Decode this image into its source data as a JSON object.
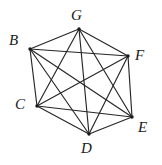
{
  "figure": {
    "name": "complete-graph-k6",
    "background_color": "#ffffff",
    "edge_color": "#262626",
    "label_color": "#1a1a1a",
    "vertex_dot_color": "#1a1a1a",
    "width": 162,
    "height": 165
  },
  "vertices": [
    {
      "id": "G",
      "label": "G",
      "x": 79,
      "y": 29,
      "label_x": 71,
      "label_y": 8
    },
    {
      "id": "B",
      "label": "B",
      "x": 30,
      "y": 49,
      "label_x": 9,
      "label_y": 33
    },
    {
      "id": "F",
      "label": "F",
      "x": 128,
      "y": 56,
      "label_x": 135,
      "label_y": 48
    },
    {
      "id": "C",
      "label": "C",
      "x": 37,
      "y": 106,
      "label_x": 15,
      "label_y": 97
    },
    {
      "id": "E",
      "label": "E",
      "x": 132,
      "y": 117,
      "label_x": 138,
      "label_y": 120
    },
    {
      "id": "D",
      "label": "D",
      "x": 89,
      "y": 134,
      "label_x": 81,
      "label_y": 141
    }
  ],
  "edges": [
    {
      "from": "B",
      "to": "C"
    },
    {
      "from": "B",
      "to": "D"
    },
    {
      "from": "B",
      "to": "E"
    },
    {
      "from": "B",
      "to": "F"
    },
    {
      "from": "B",
      "to": "G"
    },
    {
      "from": "C",
      "to": "D"
    },
    {
      "from": "C",
      "to": "E"
    },
    {
      "from": "C",
      "to": "F"
    },
    {
      "from": "C",
      "to": "G"
    },
    {
      "from": "D",
      "to": "E"
    },
    {
      "from": "D",
      "to": "F"
    },
    {
      "from": "D",
      "to": "G"
    },
    {
      "from": "E",
      "to": "F"
    },
    {
      "from": "E",
      "to": "G"
    },
    {
      "from": "F",
      "to": "G"
    }
  ],
  "meta": {
    "vertex_count": 6,
    "edge_count": 15
  }
}
